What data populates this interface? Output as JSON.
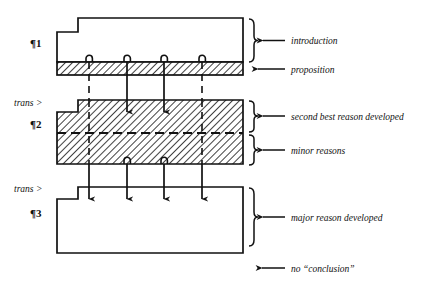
{
  "diagram": {
    "colors": {
      "stroke": "#111111",
      "hatch": "#111111",
      "background": "#ffffff"
    },
    "blocks": [
      {
        "id": "para1",
        "paragraph_label": "¶1",
        "fill": "none",
        "band": {
          "id": "proposition-band",
          "fill": "hatched"
        }
      },
      {
        "id": "para2",
        "paragraph_label": "¶2",
        "fill": "hatched",
        "transition_label": "trans >"
      },
      {
        "id": "para3",
        "paragraph_label": "¶3",
        "fill": "none",
        "transition_label": "trans >"
      }
    ],
    "annotations": [
      {
        "id": "introduction",
        "text": "introduction",
        "marker": "brace"
      },
      {
        "id": "proposition",
        "text": "proposition",
        "marker": "arrow"
      },
      {
        "id": "second-best",
        "text": "second best reason developed",
        "marker": "brace"
      },
      {
        "id": "minor-reasons",
        "text": "minor reasons",
        "marker": "brace"
      },
      {
        "id": "major-reason",
        "text": "major reason developed",
        "marker": "brace"
      },
      {
        "id": "no-conclusion",
        "text": "no “conclusion”",
        "marker": "arrow"
      }
    ],
    "connectors": {
      "count": 4,
      "x_positions": [
        89,
        127,
        164,
        202
      ],
      "styles": [
        "dashed",
        "solid",
        "solid",
        "dashed"
      ]
    }
  }
}
